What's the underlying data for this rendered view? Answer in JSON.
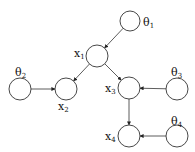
{
  "diagram": {
    "type": "bayesian-network",
    "nodes": [
      {
        "id": "theta1",
        "label": "θ",
        "sub": "1",
        "cx": 130,
        "cy": 21,
        "r": 10,
        "lx": 143,
        "ly": 26
      },
      {
        "id": "x1",
        "label": "x",
        "sub": "1",
        "cx": 97,
        "cy": 56,
        "r": 11,
        "lx": 74,
        "ly": 57
      },
      {
        "id": "theta2",
        "label": "θ",
        "sub": "2",
        "cx": 20,
        "cy": 89,
        "r": 11,
        "lx": 15,
        "ly": 76
      },
      {
        "id": "x2",
        "label": "x",
        "sub": "2",
        "cx": 66,
        "cy": 89,
        "r": 11,
        "lx": 58,
        "ly": 110
      },
      {
        "id": "x3",
        "label": "x",
        "sub": "3",
        "cx": 129,
        "cy": 88,
        "r": 11,
        "lx": 105,
        "ly": 92
      },
      {
        "id": "theta3",
        "label": "θ",
        "sub": "3",
        "cx": 177,
        "cy": 89,
        "r": 11,
        "lx": 171,
        "ly": 76
      },
      {
        "id": "x4",
        "label": "x",
        "sub": "4",
        "cx": 129,
        "cy": 136,
        "r": 11,
        "lx": 105,
        "ly": 140
      },
      {
        "id": "theta4",
        "label": "θ",
        "sub": "4",
        "cx": 177,
        "cy": 136,
        "r": 11,
        "lx": 171,
        "ly": 125
      }
    ],
    "edges": [
      {
        "from": "theta1",
        "to": "x1"
      },
      {
        "from": "x1",
        "to": "x2"
      },
      {
        "from": "x1",
        "to": "x3"
      },
      {
        "from": "theta2",
        "to": "x2"
      },
      {
        "from": "theta3",
        "to": "x3"
      },
      {
        "from": "x3",
        "to": "x4"
      },
      {
        "from": "theta4",
        "to": "x4"
      }
    ]
  }
}
